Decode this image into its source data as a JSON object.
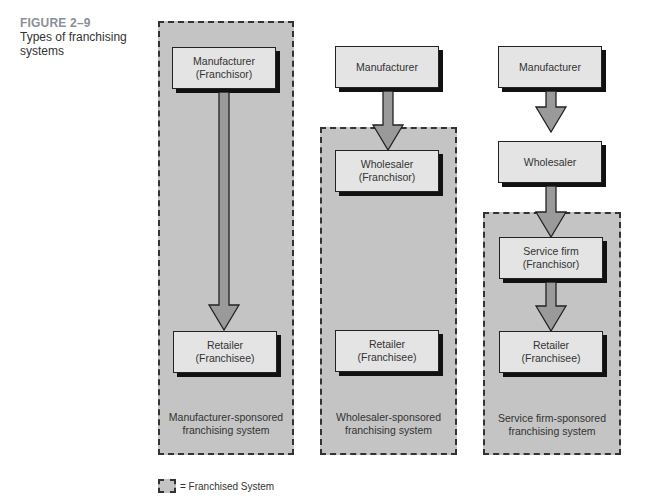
{
  "caption": {
    "figure_number": "FIGURE 2–9",
    "title_line1": "Types of franchising",
    "title_line2": "systems"
  },
  "columns": [
    {
      "system_label_line1": "Manufacturer-sponsored",
      "system_label_line2": "franchising system",
      "nodes": [
        {
          "line1": "Manufacturer",
          "line2": "(Franchisor)"
        },
        {
          "line1": "Retailer",
          "line2": "(Franchisee)"
        }
      ]
    },
    {
      "system_label_line1": "Wholesaler-sponsored",
      "system_label_line2": "franchising system",
      "nodes": [
        {
          "line1": "Manufacturer",
          "line2": ""
        },
        {
          "line1": "Wholesaler",
          "line2": "(Franchisor)"
        },
        {
          "line1": "Retailer",
          "line2": "(Franchisee)"
        }
      ]
    },
    {
      "system_label_line1": "Service firm-sponsored",
      "system_label_line2": "franchising system",
      "nodes": [
        {
          "line1": "Manufacturer",
          "line2": ""
        },
        {
          "line1": "Wholesaler",
          "line2": ""
        },
        {
          "line1": "Service firm",
          "line2": "(Franchisor)"
        },
        {
          "line1": "Retailer",
          "line2": "(Franchisee)"
        }
      ]
    }
  ],
  "legend": {
    "icon": "dashed-box-icon",
    "label": "= Franchised System"
  },
  "colors": {
    "system_fill": "#c4c4c4",
    "node_fill": "#e4e4e4",
    "arrow_fill": "#9a9a9a",
    "caption_accent": "#8a8f96"
  }
}
